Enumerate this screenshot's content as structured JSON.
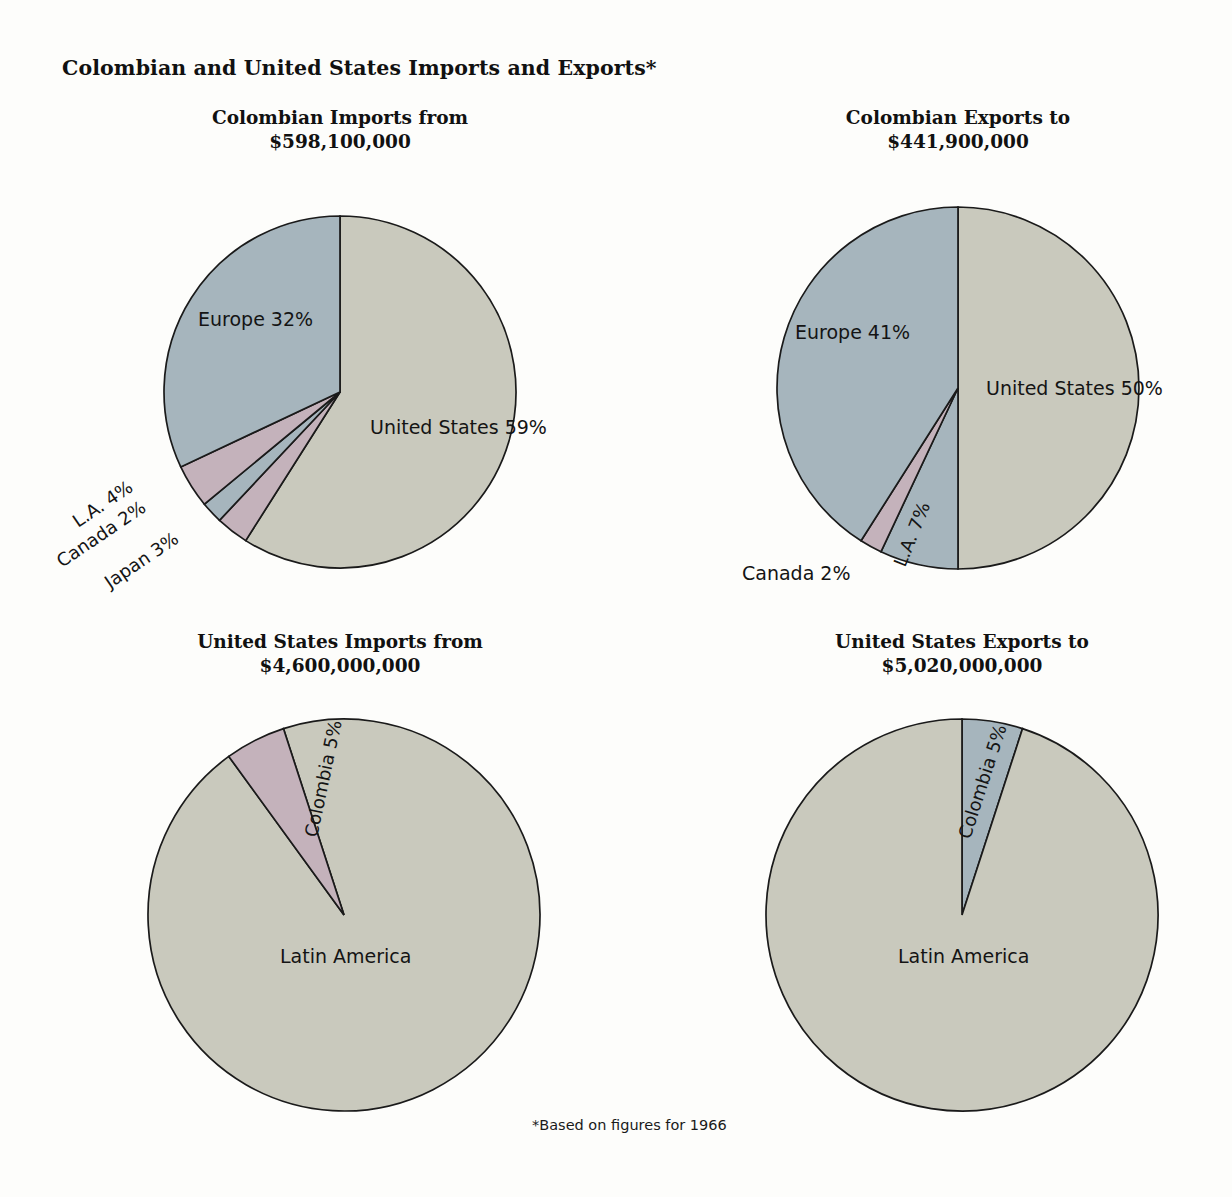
{
  "figure": {
    "title": "Colombian and United States Imports and Exports*",
    "footnote": "*Based on figures for 1966"
  },
  "colors": {
    "gray": "#c9c9bd",
    "blue": "#a6b5bd",
    "pink": "#c4b2bb",
    "outline": "#1a1a1a",
    "background": "#fdfdfb"
  },
  "panels": {
    "top_left": {
      "heading": "Colombian Imports from",
      "amount": "$598,100,000",
      "labels": {
        "united_states": "United States 59%",
        "europe": "Europe 32%",
        "la": "L.A. 4%",
        "canada": "Canada 2%",
        "japan": "Japan 3%"
      }
    },
    "top_right": {
      "heading": "Colombian Exports to",
      "amount": "$441,900,000",
      "labels": {
        "united_states": "United States 50%",
        "europe": "Europe 41%",
        "la": "L.A. 7%",
        "canada": "Canada 2%"
      }
    },
    "bottom_left": {
      "heading": "United States Imports from",
      "amount": "$4,600,000,000",
      "labels": {
        "colombia": "Colombia 5%",
        "latin_america": "Latin America"
      }
    },
    "bottom_right": {
      "heading": "United States Exports to",
      "amount": "$5,020,000,000",
      "labels": {
        "colombia": "Colombia 5%",
        "latin_america": "Latin America"
      }
    }
  },
  "chart_data": [
    {
      "type": "pie",
      "title": "Colombian Imports from",
      "subtitle": "$598,100,000",
      "total_value": 598100000,
      "unit": "USD",
      "categories": [
        "United States",
        "Japan",
        "Canada",
        "L.A.",
        "Europe"
      ],
      "values": [
        59,
        3,
        2,
        4,
        32
      ],
      "value_unit": "percent",
      "labels": [
        "United States 59%",
        "Japan 3%",
        "Canada 2%",
        "L.A. 4%",
        "Europe 32%"
      ],
      "slice_colors": [
        "#c9c9bd",
        "#c4b2bb",
        "#a6b5bd",
        "#c4b2bb",
        "#a6b5bd"
      ],
      "start_angle_deg": 0,
      "direction": "clockwise",
      "legend": "none",
      "grid": false
    },
    {
      "type": "pie",
      "title": "Colombian Exports to",
      "subtitle": "$441,900,000",
      "total_value": 441900000,
      "unit": "USD",
      "categories": [
        "United States",
        "L.A.",
        "Canada",
        "Europe"
      ],
      "values": [
        50,
        7,
        2,
        41
      ],
      "value_unit": "percent",
      "labels": [
        "United States 50%",
        "L.A. 7%",
        "Canada 2%",
        "Europe 41%"
      ],
      "slice_colors": [
        "#c9c9bd",
        "#a6b5bd",
        "#c4b2bb",
        "#a6b5bd"
      ],
      "start_angle_deg": 0,
      "direction": "clockwise",
      "legend": "none",
      "grid": false
    },
    {
      "type": "pie",
      "title": "United States Imports from",
      "subtitle": "$4,600,000,000",
      "total_value": 4600000000,
      "unit": "USD",
      "categories": [
        "Latin America",
        "Colombia"
      ],
      "values": [
        95,
        5
      ],
      "value_unit": "percent",
      "labels": [
        "Latin America",
        "Colombia 5%"
      ],
      "slice_colors": [
        "#c9c9bd",
        "#c4b2bb"
      ],
      "start_angle_deg": 0,
      "direction": "clockwise",
      "legend": "none",
      "grid": false
    },
    {
      "type": "pie",
      "title": "United States Exports to",
      "subtitle": "$5,020,000,000",
      "total_value": 5020000000,
      "unit": "USD",
      "categories": [
        "Colombia",
        "Latin America"
      ],
      "values": [
        5,
        95
      ],
      "value_unit": "percent",
      "labels": [
        "Colombia 5%",
        "Latin America"
      ],
      "slice_colors": [
        "#a6b5bd",
        "#c9c9bd"
      ],
      "start_angle_deg": 0,
      "direction": "clockwise",
      "legend": "none",
      "grid": false
    }
  ]
}
